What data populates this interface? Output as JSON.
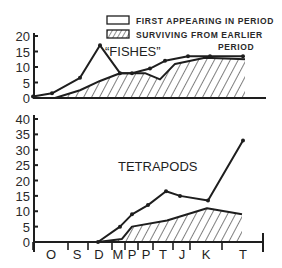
{
  "chart_data": [
    {
      "type": "area",
      "title": "\"FISHES\"",
      "xlabel": "Geologic period",
      "ylabel": "Number of orders",
      "ylim": [
        0,
        20
      ],
      "yticks": [
        0,
        5,
        10,
        15,
        20
      ],
      "categories": [
        "O",
        "S",
        "D",
        "M",
        "P",
        "P",
        "T",
        "J",
        "K",
        "T"
      ],
      "x_positions": [
        0,
        19,
        47,
        67,
        87,
        99,
        117,
        132,
        155,
        177,
        210
      ],
      "series": [
        {
          "name": "Total (first appearing + surviving)",
          "x": [
            0,
            19,
            47,
            67,
            87,
            99,
            117,
            132,
            155,
            177,
            210
          ],
          "values": [
            0.5,
            1.5,
            6.5,
            17,
            8,
            8,
            9.5,
            12,
            13.5,
            13.5,
            13.5
          ]
        },
        {
          "name": "Surviving from earlier period",
          "x": [
            22,
            47,
            67,
            87,
            112,
            127,
            142,
            172,
            212
          ],
          "values": [
            0,
            2.5,
            5.5,
            8,
            8,
            6,
            11,
            13,
            12.5
          ]
        }
      ]
    },
    {
      "type": "area",
      "title": "TETRAPODS",
      "xlabel": "Geologic period",
      "ylabel": "Number of orders",
      "ylim": [
        0,
        40
      ],
      "yticks": [
        0,
        5,
        10,
        15,
        20,
        25,
        30,
        35,
        40
      ],
      "categories": [
        "O",
        "S",
        "D",
        "M",
        "P",
        "P",
        "T",
        "J",
        "K",
        "T"
      ],
      "series": [
        {
          "name": "Total (first appearing + surviving)",
          "x": [
            65,
            87,
            99,
            115,
            133,
            147,
            175,
            210
          ],
          "values": [
            0,
            5,
            9,
            12,
            16.5,
            15,
            13.5,
            33
          ]
        },
        {
          "name": "Surviving from earlier period",
          "x": [
            65,
            89,
            99,
            134,
            174,
            209
          ],
          "values": [
            0,
            1,
            5,
            7,
            11,
            9
          ]
        }
      ]
    }
  ],
  "legend": {
    "first_appearing": "FIRST APPEARING IN PERIOD",
    "surviving_line1": "SURVIVING FROM EARLIER",
    "surviving_line2": "PERIOD"
  },
  "top_chart": {
    "title": "“FISHES”",
    "yticks": [
      "20",
      "15",
      "10",
      "5",
      "0"
    ]
  },
  "bottom_chart": {
    "title": "TETRAPODS",
    "yticks": [
      "40",
      "35",
      "30",
      "25",
      "20",
      "15",
      "10",
      "5",
      "0"
    ],
    "periods": [
      "O",
      "S",
      "D",
      "M",
      "P",
      "P",
      "T",
      "J",
      "K",
      "T"
    ]
  }
}
